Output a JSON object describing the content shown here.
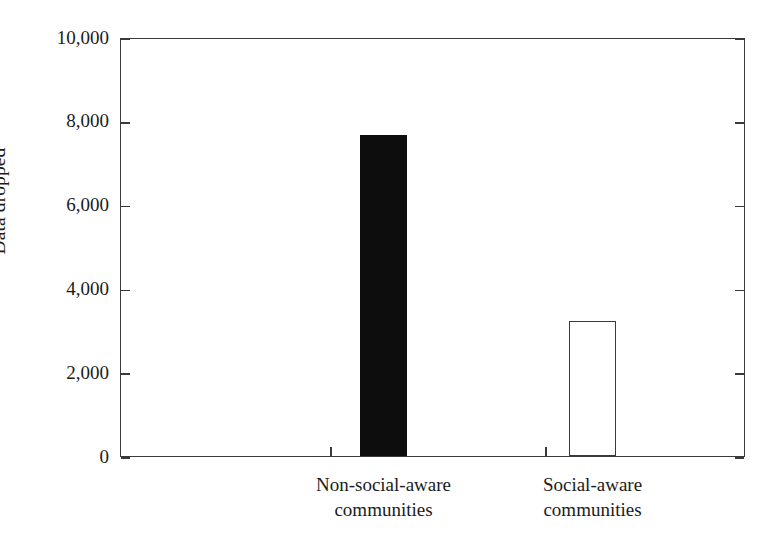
{
  "chart_data": {
    "type": "bar",
    "title": "",
    "subtitle": "",
    "xlabel": "",
    "ylabel": "Data dropped",
    "categories": [
      "Non-social-aware communities",
      "Social-aware communities"
    ],
    "category_lines": [
      [
        "Non-social-aware",
        "communities"
      ],
      [
        "Social-aware",
        "communities"
      ]
    ],
    "values": [
      7650,
      3220
    ],
    "ylim": [
      0,
      10000
    ],
    "ytick_values": [
      0,
      2000,
      4000,
      6000,
      8000,
      10000
    ],
    "ytick_labels": [
      "0",
      "2,000",
      "4,000",
      "6,000",
      "8,000",
      "10,000"
    ],
    "grid": false,
    "legend": null,
    "legend_position": "none",
    "bar_styles": [
      {
        "name": "filled-black-bar",
        "fill": "#0d0d0d",
        "edge": "#0d0d0d"
      },
      {
        "name": "open-white-bar",
        "fill": "#ffffff",
        "edge": "#3a3a3a"
      }
    ],
    "axis_color": "#3a3a3a",
    "text_color": "#1b1b1b",
    "background": "#ffffff"
  }
}
